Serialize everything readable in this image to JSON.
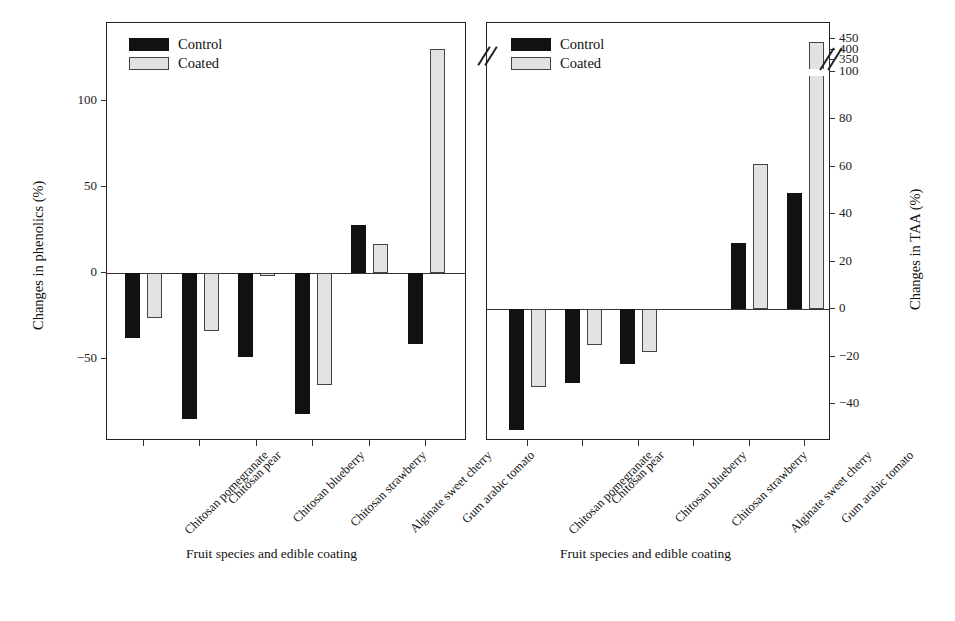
{
  "figure": {
    "legend": {
      "control_label": "Control",
      "coated_label": "Coated"
    },
    "colors": {
      "control": "#111111",
      "coated": "#e2e2e2",
      "axis": "#222222"
    }
  },
  "chart_data": [
    {
      "type": "bar",
      "panel": "left",
      "title": "",
      "xlabel": "Fruit species and edible coating",
      "ylabel": "Changes in phenolics (%)",
      "categories": [
        "Chitosan pomegranate",
        "Chitosan pear",
        "Chitosan blueberry",
        "Chitosan strawberry",
        "Alginate sweet cherry",
        "Gum arabic tomato"
      ],
      "series": [
        {
          "name": "Control",
          "values": [
            -38,
            -85,
            -49,
            -82,
            28,
            -41
          ]
        },
        {
          "name": "Coated",
          "values": [
            -26,
            -34,
            -2,
            -65,
            17,
            130
          ]
        }
      ],
      "yticks": [
        100,
        50,
        0,
        -50
      ],
      "ytick_labels": [
        "100",
        "50",
        "0",
        "−50"
      ],
      "ylim": [
        -100,
        140
      ],
      "grid": false,
      "legend_position": "top-left",
      "axis_break": false
    },
    {
      "type": "bar",
      "panel": "right",
      "title": "",
      "xlabel": "Fruit species and edible coating",
      "ylabel": "Changes in TAA (%)",
      "categories": [
        "Chitosan pomegranate",
        "Chitosan pear",
        "Chitosan blueberry",
        "Chitosan strawberry",
        "Alginate sweet cherry",
        "Gum arabic tomato"
      ],
      "series": [
        {
          "name": "Control",
          "values": [
            -51,
            -31,
            -23,
            null,
            28,
            49
          ]
        },
        {
          "name": "Coated",
          "values": [
            -33,
            -15,
            -18,
            null,
            61,
            435
          ]
        }
      ],
      "yticks": [
        450,
        400,
        350,
        100,
        80,
        60,
        40,
        20,
        0,
        -20,
        -40
      ],
      "ytick_labels": [
        "450",
        "400",
        "350",
        "100",
        "80",
        "60",
        "40",
        "20",
        "0",
        "−20",
        "−40"
      ],
      "ylim": [
        -50,
        450
      ],
      "grid": false,
      "legend_position": "top-left",
      "axis_break": true,
      "axis_break_between": [
        100,
        350
      ]
    }
  ]
}
